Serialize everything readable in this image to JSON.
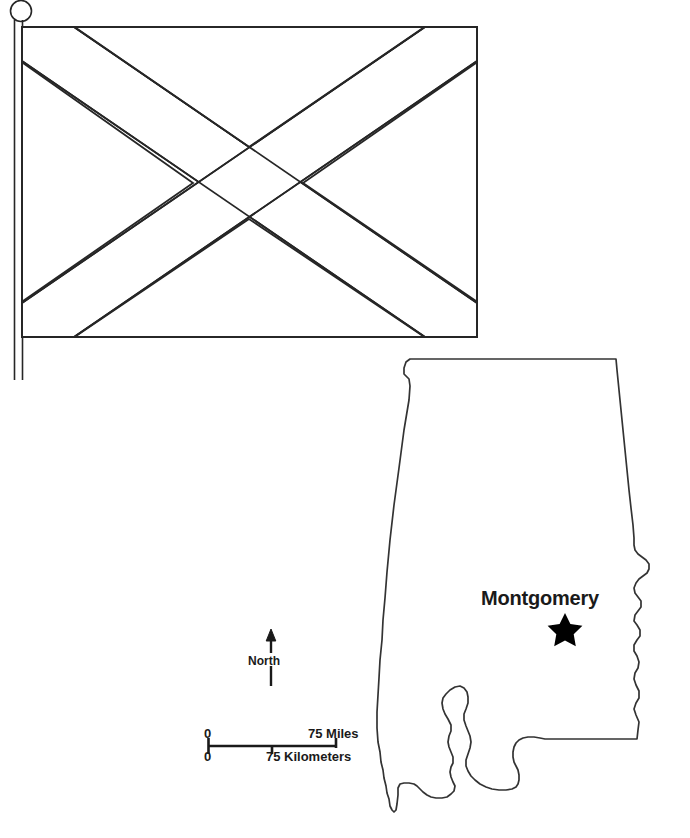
{
  "page": {
    "background_color": "#ffffff",
    "width": 690,
    "height": 838
  },
  "flag": {
    "name": "Alabama State Flag",
    "description": "Crimson saltire (St. Andrew's cross) on a white field, shown as a black-and-white line outline on a flagpole",
    "line_color": "#262626",
    "fill_color": "#ffffff",
    "pole": {
      "name": "flagpole",
      "finial": "ball-finial"
    }
  },
  "map": {
    "name": "Alabama state outline map",
    "outline_color": "#333333",
    "fill_color": "#ffffff",
    "capital": {
      "label": "Montgomery",
      "marker": "star-marker",
      "marker_color": "#000000"
    }
  },
  "north_arrow": {
    "label": "North",
    "icon": "north-arrow-icon"
  },
  "scale_bar": {
    "miles": {
      "start": "0",
      "end": "75 Miles"
    },
    "kilometers": {
      "start": "0",
      "end": "75 Kilometers"
    },
    "bar_color": "#1a1a1a"
  }
}
